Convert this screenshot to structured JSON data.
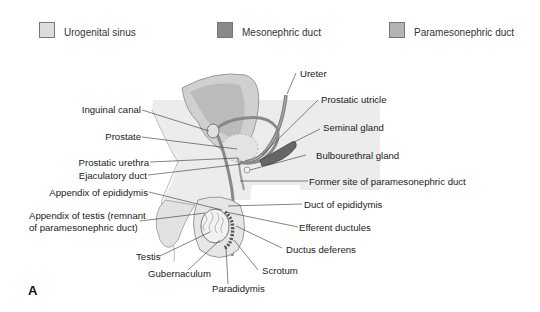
{
  "legend": [
    {
      "label": "Urogenital sinus",
      "color": "#dcdcdc"
    },
    {
      "label": "Mesonephric duct",
      "color": "#8a8a8a"
    },
    {
      "label": "Paramesonephric duct",
      "color": "#b4b4b4"
    }
  ],
  "labels_left": {
    "inguinal_canal": "Inguinal canal",
    "prostate": "Prostate",
    "prostatic_urethra": "Prostatic urethra",
    "ejaculatory_duct": "Ejaculatory duct",
    "appendix_of_epididymis": "Appendix of epididymis",
    "appendix_of_testis_line1": "Appendix of testis (remnant",
    "appendix_of_testis_line2": "of paramesonephric duct)",
    "testis": "Testis",
    "gubernaculum": "Gubernaculum"
  },
  "labels_right": {
    "ureter": "Ureter",
    "prostatic_utricle": "Prostatic utricle",
    "seminal_gland": "Seminal gland",
    "bulbourethral_gland": "Bulbourethral gland",
    "former_site": "Former site of paramesonephric duct",
    "duct_of_epididymis": "Duct of epididymis",
    "efferent_ductules": "Efferent ductules",
    "ductus_deferens": "Ductus deferens",
    "scrotum": "Scrotum",
    "paradidymis": "Paradidymis"
  },
  "panel_letter": "A"
}
